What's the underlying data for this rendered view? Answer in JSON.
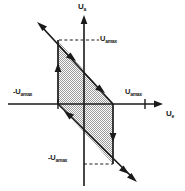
{
  "figure": {
    "kind": "hysteresis-transfer-characteristic",
    "background_color": "#ffffff",
    "line_color": "#1a1a1a",
    "fill_color": "#c8c8c8",
    "fill_pattern": "dithered-checkerboard"
  },
  "axes": {
    "y_axis_label": "U",
    "y_axis_subscript": "a",
    "x_axis_label": "U",
    "x_axis_subscript": "e",
    "origin_px": {
      "x": 84,
      "y": 104
    },
    "x_range_px": {
      "min": 8,
      "max": 160
    },
    "y_range_px": {
      "min": 14,
      "max": 186
    }
  },
  "ticks": [
    {
      "name": "x-tick-negative",
      "label": "-U",
      "subscript": "amax",
      "x_px": 58,
      "axis": "x"
    },
    {
      "name": "x-tick-positive",
      "label": "U",
      "subscript": "amax",
      "x_px": 145,
      "axis": "x"
    }
  ],
  "reference_lines": [
    {
      "name": "upper-dashed",
      "label": "U",
      "subscript": "amax",
      "y_px": 40,
      "from_x_px": 59,
      "to_x_px": 97,
      "style": "dashed"
    },
    {
      "name": "lower-dashed",
      "label": "-U",
      "subscript": "amax",
      "y_px": 164,
      "from_x_px": 84,
      "to_x_px": 112,
      "style": "dashed"
    }
  ],
  "loop": {
    "description": "Shaded parallelogram hysteresis region",
    "vertices_px": [
      {
        "x": 58,
        "y": 40
      },
      {
        "x": 113,
        "y": 104
      },
      {
        "x": 113,
        "y": 164
      },
      {
        "x": 58,
        "y": 104
      }
    ],
    "extensions": [
      {
        "name": "upper-left-extension",
        "from": {
          "x": 58,
          "y": 40
        },
        "to": {
          "x": 38,
          "y": 24
        },
        "arrow": "up-left"
      },
      {
        "name": "lower-right-extension",
        "from": {
          "x": 113,
          "y": 164
        },
        "to": {
          "x": 136,
          "y": 180
        },
        "arrow": "down-right"
      }
    ],
    "direction_arrows": [
      {
        "name": "arrow-upper-diagonal",
        "x": 72,
        "y": 57,
        "angle_deg": 49,
        "direction": "down-right"
      },
      {
        "name": "arrow-upper-diagonal-2",
        "x": 100,
        "y": 90,
        "angle_deg": 49,
        "direction": "down-right"
      },
      {
        "name": "arrow-left-vertical",
        "x": 58,
        "y": 70,
        "angle_deg": -90,
        "direction": "up"
      },
      {
        "name": "arrow-right-vertical",
        "x": 113,
        "y": 134,
        "angle_deg": 90,
        "direction": "down"
      },
      {
        "name": "arrow-lower-diagonal",
        "x": 70,
        "y": 117,
        "angle_deg": 229,
        "direction": "up-left"
      },
      {
        "name": "arrow-lower-diagonal-2",
        "x": 125,
        "y": 172,
        "angle_deg": 49,
        "direction": "down-right"
      }
    ]
  }
}
